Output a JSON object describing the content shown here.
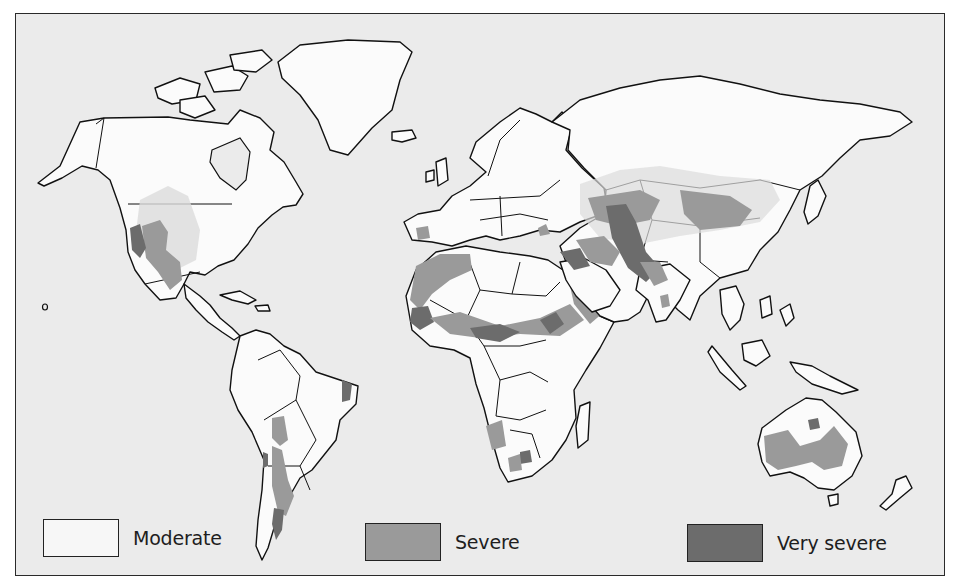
{
  "map": {
    "type": "world choropleth",
    "subject": "desertification severity"
  },
  "legend": {
    "items": [
      {
        "label": "Moderate",
        "color": "#f7f7f7"
      },
      {
        "label": "Severe",
        "color": "#9a9a9a"
      },
      {
        "label": "Very severe",
        "color": "#6c6c6c"
      }
    ]
  },
  "colors": {
    "background": "#ebebeb",
    "land": "#fbfbfb",
    "outline": "#111111"
  }
}
